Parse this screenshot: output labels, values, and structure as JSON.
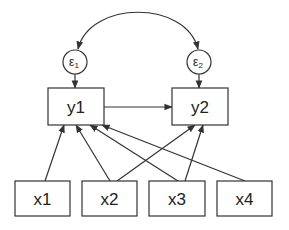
{
  "diagram": {
    "type": "path diagram (structural equation model)",
    "errors": [
      {
        "id": "e1",
        "symbol": "ε",
        "subscript": "1",
        "cx": 75,
        "cy": 62,
        "r": 12
      },
      {
        "id": "e2",
        "symbol": "ε",
        "subscript": "2",
        "cx": 199,
        "cy": 62,
        "r": 12
      }
    ],
    "endogenous": [
      {
        "id": "y1",
        "label": "y1",
        "x": 48,
        "y": 88,
        "w": 56,
        "h": 37
      },
      {
        "id": "y2",
        "label": "y2",
        "x": 172,
        "y": 88,
        "w": 56,
        "h": 37
      }
    ],
    "exogenous": [
      {
        "id": "x1",
        "label": "x1",
        "x": 15,
        "y": 181,
        "w": 55,
        "h": 35
      },
      {
        "id": "x2",
        "label": "x2",
        "x": 82,
        "y": 181,
        "w": 55,
        "h": 35
      },
      {
        "id": "x3",
        "label": "x3",
        "x": 149,
        "y": 181,
        "w": 56,
        "h": 35
      },
      {
        "id": "x4",
        "label": "x4",
        "x": 217,
        "y": 181,
        "w": 55,
        "h": 35
      }
    ],
    "edges": [
      {
        "from": "e1",
        "to": "e2",
        "kind": "covariance (curved, double-headed)"
      },
      {
        "from": "e1",
        "to": "y1",
        "kind": "directed"
      },
      {
        "from": "e2",
        "to": "y2",
        "kind": "directed"
      },
      {
        "from": "y1",
        "to": "y2",
        "kind": "directed"
      },
      {
        "from": "x1",
        "to": "y1",
        "kind": "directed"
      },
      {
        "from": "x2",
        "to": "y1",
        "kind": "directed"
      },
      {
        "from": "x3",
        "to": "y1",
        "kind": "directed"
      },
      {
        "from": "x4",
        "to": "y1",
        "kind": "directed"
      },
      {
        "from": "x2",
        "to": "y2",
        "kind": "directed"
      },
      {
        "from": "x3",
        "to": "y2",
        "kind": "directed"
      }
    ]
  }
}
